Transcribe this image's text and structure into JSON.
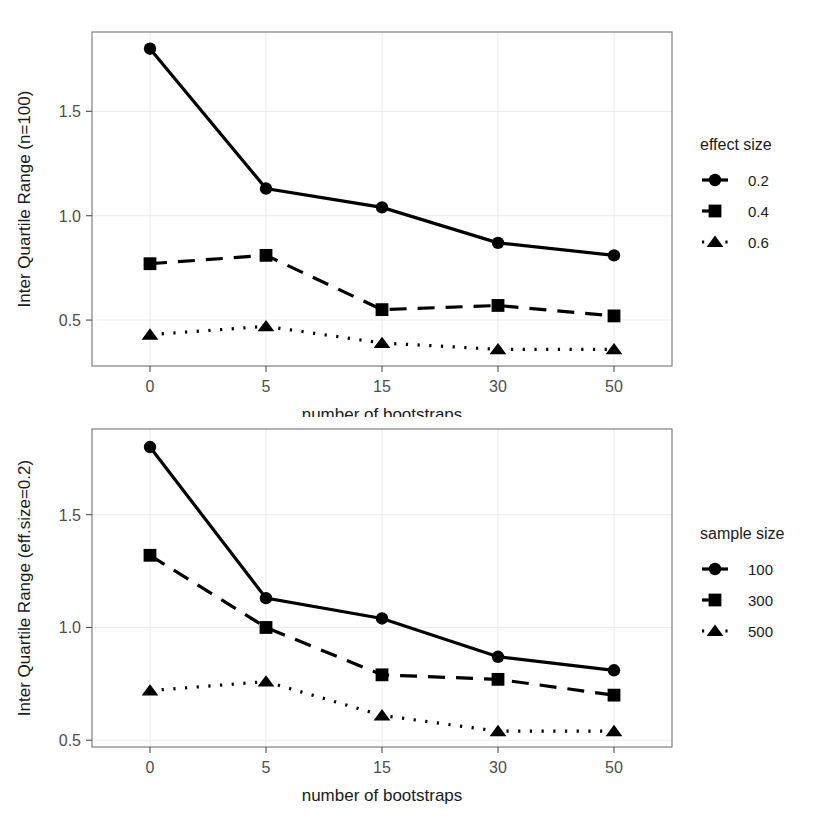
{
  "figure": {
    "background": "#ffffff",
    "panel_border_color": "#808080",
    "grid_color": "#ebebeb",
    "series_color": "#000000"
  },
  "charts": [
    {
      "id": "top",
      "chart_data": {
        "type": "line",
        "title": "",
        "xlabel": "number of bootstraps",
        "ylabel": "Inter Quartile Range (n=100)",
        "categories": [
          "0",
          "5",
          "15",
          "30",
          "50"
        ],
        "x": [
          0,
          5,
          15,
          30,
          50
        ],
        "xtick_labels": [
          "0",
          "5",
          "15",
          "30",
          "50"
        ],
        "ytick_labels": [
          "0.5",
          "1.0",
          "1.5"
        ],
        "yticks": [
          0.5,
          1.0,
          1.5
        ],
        "ylim": [
          0.28,
          1.88
        ],
        "grid": true,
        "legend": {
          "title": "effect size",
          "position": "right",
          "entries": [
            {
              "label": "0.2",
              "marker": "circle",
              "line": "solid"
            },
            {
              "label": "0.4",
              "marker": "square",
              "line": "dashed"
            },
            {
              "label": "0.6",
              "marker": "triangle",
              "line": "dotted"
            }
          ]
        },
        "series": [
          {
            "name": "0.2",
            "marker": "circle",
            "line": "solid",
            "values": [
              1.8,
              1.13,
              1.04,
              0.87,
              0.81
            ]
          },
          {
            "name": "0.4",
            "marker": "square",
            "line": "dashed",
            "values": [
              0.77,
              0.81,
              0.55,
              0.57,
              0.52
            ]
          },
          {
            "name": "0.6",
            "marker": "triangle",
            "line": "dotted",
            "values": [
              0.43,
              0.47,
              0.39,
              0.36,
              0.36
            ]
          }
        ]
      }
    },
    {
      "id": "bottom",
      "chart_data": {
        "type": "line",
        "title": "",
        "xlabel": "number of bootstraps",
        "ylabel": "Inter Quartile Range (eff.size=0.2)",
        "categories": [
          "0",
          "5",
          "15",
          "30",
          "50"
        ],
        "x": [
          0,
          5,
          15,
          30,
          50
        ],
        "xtick_labels": [
          "0",
          "5",
          "15",
          "30",
          "50"
        ],
        "ytick_labels": [
          "0.5",
          "1.0",
          "1.5"
        ],
        "yticks": [
          0.5,
          1.0,
          1.5
        ],
        "ylim": [
          0.47,
          1.88
        ],
        "grid": true,
        "legend": {
          "title": "sample size",
          "position": "right",
          "entries": [
            {
              "label": "100",
              "marker": "circle",
              "line": "solid"
            },
            {
              "label": "300",
              "marker": "square",
              "line": "dashed"
            },
            {
              "label": "500",
              "marker": "triangle",
              "line": "dotted"
            }
          ]
        },
        "series": [
          {
            "name": "100",
            "marker": "circle",
            "line": "solid",
            "values": [
              1.8,
              1.13,
              1.04,
              0.87,
              0.81
            ]
          },
          {
            "name": "300",
            "marker": "square",
            "line": "dashed",
            "values": [
              1.32,
              1.0,
              0.79,
              0.77,
              0.7
            ]
          },
          {
            "name": "500",
            "marker": "triangle",
            "line": "dotted",
            "values": [
              0.72,
              0.76,
              0.61,
              0.54,
              0.54
            ]
          }
        ]
      }
    }
  ]
}
